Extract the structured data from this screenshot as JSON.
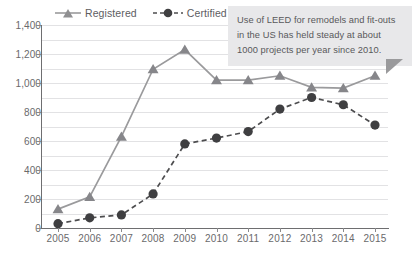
{
  "chart_data": {
    "type": "line",
    "title": "",
    "subtitle": "",
    "xlabel": "",
    "ylabel": "",
    "categories": [
      "2005",
      "2006",
      "2007",
      "2008",
      "2009",
      "2010",
      "2011",
      "2012",
      "2013",
      "2014",
      "2015"
    ],
    "ylim": [
      0,
      1400
    ],
    "ytick_step": 200,
    "ytick_labels": [
      "0",
      "200",
      "400",
      "600",
      "800",
      "1,000",
      "1,200",
      "1,400"
    ],
    "ytick_values": [
      0,
      200,
      400,
      600,
      800,
      1000,
      1200,
      1400
    ],
    "grid": true,
    "grid_minor_step": 100,
    "legend_position": "top",
    "series": [
      {
        "name": "Registered",
        "marker": "triangle",
        "line_style": "solid",
        "color": "#9a9a9c",
        "values": [
          130,
          215,
          630,
          1095,
          1230,
          1020,
          1020,
          1050,
          970,
          965,
          1050
        ]
      },
      {
        "name": "Certified",
        "marker": "circle",
        "line_style": "dashed",
        "color": "#4d4d4f",
        "values": [
          30,
          70,
          90,
          235,
          580,
          620,
          665,
          820,
          900,
          850,
          710
        ]
      }
    ],
    "annotations": [
      {
        "name": "callout",
        "text": "Use of LEED for remodels and fit-outs in the US has held steady at about 1000 projects per year since 2010."
      }
    ]
  },
  "legend": {
    "items": [
      {
        "label": "Registered"
      },
      {
        "label": "Certified"
      }
    ]
  },
  "callout": {
    "line1": "Use of LEED for remodels and fit-outs",
    "line2": "in the US has held steady at about",
    "line3": "1000 projects per year since 2010."
  },
  "colors": {
    "registered": "#9a9a9c",
    "certified": "#4d4d4f",
    "grid": "#e2e2e4",
    "axis": "#6e6e70",
    "text": "#6a6a6c",
    "callout_bg": "#e8e8ea"
  }
}
